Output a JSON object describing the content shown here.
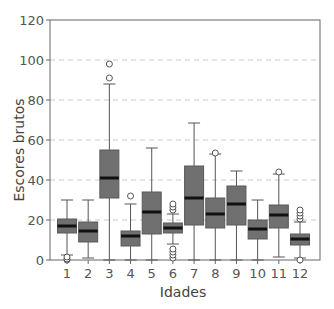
{
  "chart_data": {
    "type": "box",
    "title": "",
    "xlabel": "Idades",
    "ylabel": "Escores brutos",
    "ylim": [
      0,
      120
    ],
    "yticks": [
      0,
      20,
      40,
      60,
      80,
      100,
      120
    ],
    "grid": {
      "y": true,
      "style": "dashed",
      "lines": [
        20,
        40,
        60,
        80,
        100
      ]
    },
    "categories": [
      "1",
      "2",
      "3",
      "4",
      "5",
      "6",
      "7",
      "8",
      "9",
      "10",
      "11",
      "12"
    ],
    "boxes": [
      {
        "label": "1",
        "whisker_low": 2.5,
        "q1": 13.5,
        "median": 17,
        "q3": 20.5,
        "whisker_high": 30,
        "outliers": [
          0,
          0.5,
          1.5
        ]
      },
      {
        "label": "2",
        "whisker_low": 1,
        "q1": 9,
        "median": 14.5,
        "q3": 19,
        "whisker_high": 30,
        "outliers": []
      },
      {
        "label": "3",
        "whisker_low": 0,
        "q1": 31,
        "median": 41,
        "q3": 55,
        "whisker_high": 88,
        "outliers": [
          91,
          98
        ]
      },
      {
        "label": "4",
        "whisker_low": 0,
        "q1": 7,
        "median": 12,
        "q3": 14.5,
        "whisker_high": 28,
        "outliers": [
          32
        ]
      },
      {
        "label": "5",
        "whisker_low": 0,
        "q1": 13,
        "median": 24,
        "q3": 34,
        "whisker_high": 56,
        "outliers": []
      },
      {
        "label": "6",
        "whisker_low": 8,
        "q1": 13.5,
        "median": 16,
        "q3": 18.5,
        "whisker_high": 23,
        "outliers": [
          25,
          26.5,
          28,
          1,
          2.5,
          4,
          5.5
        ]
      },
      {
        "label": "7",
        "whisker_low": 0,
        "q1": 17.5,
        "median": 31,
        "q3": 47,
        "whisker_high": 68.5,
        "outliers": []
      },
      {
        "label": "8",
        "whisker_low": 0,
        "q1": 16,
        "median": 23,
        "q3": 31,
        "whisker_high": 53,
        "outliers": [
          53.5
        ]
      },
      {
        "label": "9",
        "whisker_low": 0,
        "q1": 17.5,
        "median": 28,
        "q3": 37,
        "whisker_high": 44.5,
        "outliers": []
      },
      {
        "label": "10",
        "whisker_low": 0,
        "q1": 10.5,
        "median": 15.5,
        "q3": 20,
        "whisker_high": 30,
        "outliers": []
      },
      {
        "label": "11",
        "whisker_low": 1.5,
        "q1": 16,
        "median": 22.5,
        "q3": 27.5,
        "whisker_high": 43,
        "outliers": [
          44
        ]
      },
      {
        "label": "12",
        "whisker_low": 1,
        "q1": 7.5,
        "median": 10.5,
        "q3": 13,
        "whisker_high": 19,
        "outliers": [
          20.5,
          22,
          23.5,
          25,
          0
        ]
      }
    ],
    "colors": {
      "box_fill": "#707070",
      "box_stroke": "#5a5a5a",
      "median": "#111111",
      "whisker": "#555555",
      "grid": "#c8c8c8",
      "axis": "#666666"
    }
  }
}
